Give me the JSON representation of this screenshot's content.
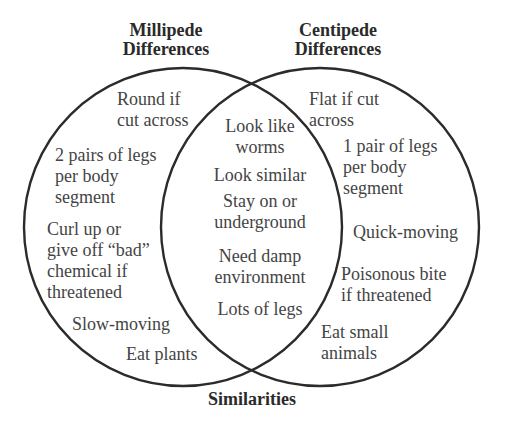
{
  "diagram": {
    "type": "venn",
    "stroke_color": "#2b2b2b",
    "text_color": "#444444",
    "title_color": "#2a2a2a",
    "left_circle": {
      "title_lines": [
        "Millipede",
        "Differences"
      ],
      "items": [
        {
          "lines": [
            "Round if",
            "cut across"
          ]
        },
        {
          "lines": [
            "2 pairs of legs",
            "per body",
            "segment"
          ]
        },
        {
          "lines": [
            "Curl up or",
            "give off “bad”",
            "chemical if",
            "threatened"
          ]
        },
        {
          "lines": [
            "Slow-moving"
          ]
        },
        {
          "lines": [
            "Eat plants"
          ]
        }
      ]
    },
    "right_circle": {
      "title_lines": [
        "Centipede",
        "Differences"
      ],
      "items": [
        {
          "lines": [
            "Flat if cut",
            "across"
          ]
        },
        {
          "lines": [
            "1 pair of legs",
            "per body",
            "segment"
          ]
        },
        {
          "lines": [
            "Quick-moving"
          ]
        },
        {
          "lines": [
            "Poisonous bite",
            "if threatened"
          ]
        },
        {
          "lines": [
            "Eat small",
            "animals"
          ]
        }
      ]
    },
    "overlap": {
      "title": "Similarities",
      "items": [
        {
          "lines": [
            "Look like",
            "worms"
          ]
        },
        {
          "lines": [
            "Look similar"
          ]
        },
        {
          "lines": [
            "Stay on or",
            "underground"
          ]
        },
        {
          "lines": [
            "Need damp",
            "environment"
          ]
        },
        {
          "lines": [
            "Lots of legs"
          ]
        }
      ]
    }
  }
}
